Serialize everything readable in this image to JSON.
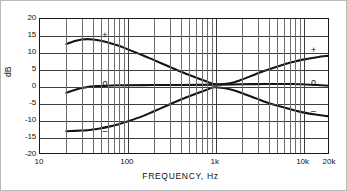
{
  "chart_data": {
    "type": "line",
    "title": "",
    "xlabel": "FREQUENCY,   Hz",
    "ylabel": "dB",
    "xscale": "log",
    "xlim": [
      10,
      20000
    ],
    "ylim": [
      -20,
      20
    ],
    "grid": true,
    "legend_position": "inline-annotations",
    "x_ticks_labeled": [
      "10",
      "100",
      "1k",
      "10k",
      "20k"
    ],
    "x_tick_values": [
      10,
      100,
      1000,
      10000,
      20000
    ],
    "y_ticks": [
      "20",
      "15",
      "10",
      "5",
      "0",
      "-5",
      "-10",
      "-15",
      "-20"
    ],
    "y_tick_values": [
      20,
      15,
      10,
      5,
      0,
      -5,
      -10,
      -15,
      -20
    ],
    "x_minor_ticks": [
      20,
      30,
      40,
      50,
      60,
      70,
      80,
      90,
      200,
      300,
      400,
      500,
      600,
      700,
      800,
      900,
      2000,
      3000,
      4000,
      5000,
      6000,
      7000,
      8000,
      9000
    ],
    "series": [
      {
        "name": "+",
        "label_left": "+",
        "label_right": "+",
        "x": [
          20,
          25,
          30,
          35,
          40,
          50,
          60,
          80,
          100,
          150,
          200,
          300,
          400,
          600,
          800,
          1000,
          1500,
          2000,
          3000,
          4000,
          6000,
          8000,
          10000,
          15000,
          20000
        ],
        "values": [
          12.5,
          13.4,
          13.9,
          14.0,
          13.9,
          13.5,
          13.0,
          12.0,
          11.0,
          9.2,
          7.8,
          5.8,
          4.4,
          2.6,
          1.4,
          0.6,
          0.8,
          1.8,
          3.6,
          4.8,
          6.3,
          7.2,
          7.8,
          8.6,
          9.0
        ]
      },
      {
        "name": "0",
        "label_left": "0",
        "label_right": "0",
        "x": [
          20,
          25,
          30,
          35,
          40,
          50,
          60,
          80,
          100,
          200,
          400,
          1000,
          2000,
          4000,
          8000,
          10000,
          15000,
          20000
        ],
        "values": [
          -2.0,
          -1.2,
          -0.6,
          -0.3,
          -0.1,
          0.0,
          0.1,
          0.2,
          0.2,
          0.3,
          0.3,
          0.4,
          0.5,
          0.6,
          0.6,
          0.5,
          0.3,
          0.1
        ]
      },
      {
        "name": "-",
        "label_left": "–",
        "label_right": "–",
        "x": [
          20,
          25,
          30,
          35,
          40,
          50,
          60,
          80,
          100,
          150,
          200,
          300,
          400,
          600,
          800,
          1000,
          1500,
          2000,
          3000,
          4000,
          6000,
          8000,
          10000,
          15000,
          20000
        ],
        "values": [
          -13.5,
          -13.4,
          -13.3,
          -13.2,
          -13.0,
          -12.6,
          -12.2,
          -11.4,
          -10.6,
          -9.0,
          -7.6,
          -5.6,
          -4.2,
          -2.4,
          -1.2,
          -0.4,
          -1.0,
          -2.0,
          -3.7,
          -4.9,
          -6.3,
          -7.2,
          -7.8,
          -8.6,
          -9.0
        ]
      }
    ],
    "annotations": [
      {
        "text": "+",
        "x_hz": 55,
        "y_db": 15.2,
        "side": "left"
      },
      {
        "text": "0",
        "x_hz": 55,
        "y_db": 0.9,
        "side": "left"
      },
      {
        "text": "–",
        "x_hz": 55,
        "y_db": -13.0,
        "side": "left"
      },
      {
        "text": "+",
        "x_hz": 13000,
        "y_db": 11.0,
        "side": "right"
      },
      {
        "text": "0",
        "x_hz": 13000,
        "y_db": 1.1,
        "side": "right"
      },
      {
        "text": "–",
        "x_hz": 13000,
        "y_db": -7.1,
        "side": "right"
      }
    ]
  }
}
